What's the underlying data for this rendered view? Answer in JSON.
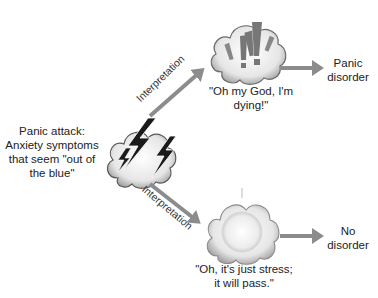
{
  "trigger": {
    "label_line1": "Panic attack:",
    "label_line2": "Anxiety symptoms",
    "label_line3": "that seem \"out of",
    "label_line4": "the blue\"",
    "icon": "lightning-cloud-icon"
  },
  "upper_path": {
    "arrow_label": "Interpretation",
    "thought_icon": "exclamation-cloud-icon",
    "quote_line1": "\"Oh my God, I'm",
    "quote_line2": "dying!\"",
    "outcome_line1": "Panic",
    "outcome_line2": "disorder"
  },
  "lower_path": {
    "arrow_label": "Interpretation",
    "thought_icon": "calm-sun-cloud-icon",
    "quote_line1": "\"Oh, it's just stress;",
    "quote_line2": "it will pass.\"",
    "outcome_line1": "No",
    "outcome_line2": "disorder"
  },
  "colors": {
    "arrow": "#8c8c8c",
    "cloud_fill": "#f2f2f2",
    "cloud_stroke": "#6a6a6a",
    "bolt": "#1a1a1a",
    "exclaim": "#777777",
    "text": "#222222"
  }
}
